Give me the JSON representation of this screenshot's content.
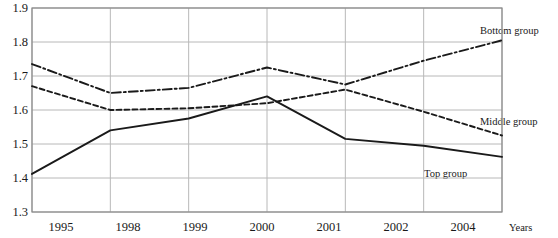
{
  "chart_data": {
    "type": "line",
    "title": "",
    "xlabel": "Years",
    "ylabel": "",
    "categories": [
      "1995",
      "1998",
      "1999",
      "2000",
      "2001",
      "2002",
      "2004"
    ],
    "ylim": [
      1.3,
      1.9
    ],
    "yticks": [
      "1.9",
      "1.8",
      "1.7",
      "1.6",
      "1.5",
      "1.4",
      "1.3"
    ],
    "ytick_values": [
      1.9,
      1.8,
      1.7,
      1.6,
      1.5,
      1.4,
      1.3
    ],
    "grid": true,
    "legend": "inline-labels",
    "series": [
      {
        "name": "Bottom group",
        "style": "dash-dot",
        "color": "#1a1a1a",
        "values": [
          1.735,
          1.65,
          1.665,
          1.725,
          1.675,
          1.745,
          1.805
        ]
      },
      {
        "name": "Middle group",
        "style": "dashed",
        "color": "#1a1a1a",
        "values": [
          1.67,
          1.6,
          1.605,
          1.62,
          1.66,
          1.595,
          1.525
        ]
      },
      {
        "name": "Top group",
        "style": "solid",
        "color": "#1a1a1a",
        "values": [
          1.412,
          1.54,
          1.575,
          1.64,
          1.515,
          1.495,
          1.462
        ]
      }
    ]
  },
  "annotations": {
    "bottom_group_label": "Bottom group",
    "middle_group_label": "Middle group",
    "top_group_label": "Top group",
    "years_axis_label": "Years"
  },
  "ticks": {
    "y": [
      "1.9",
      "1.8",
      "1.7",
      "1.6",
      "1.5",
      "1.4",
      "1.3"
    ],
    "x": [
      "1995",
      "1998",
      "1999",
      "2000",
      "2001",
      "2002",
      "2004"
    ]
  },
  "colors": {
    "line": "#1a1a1a",
    "grid": "#b8b8b8",
    "axis": "#8a8a8a",
    "background": "#ffffff"
  }
}
